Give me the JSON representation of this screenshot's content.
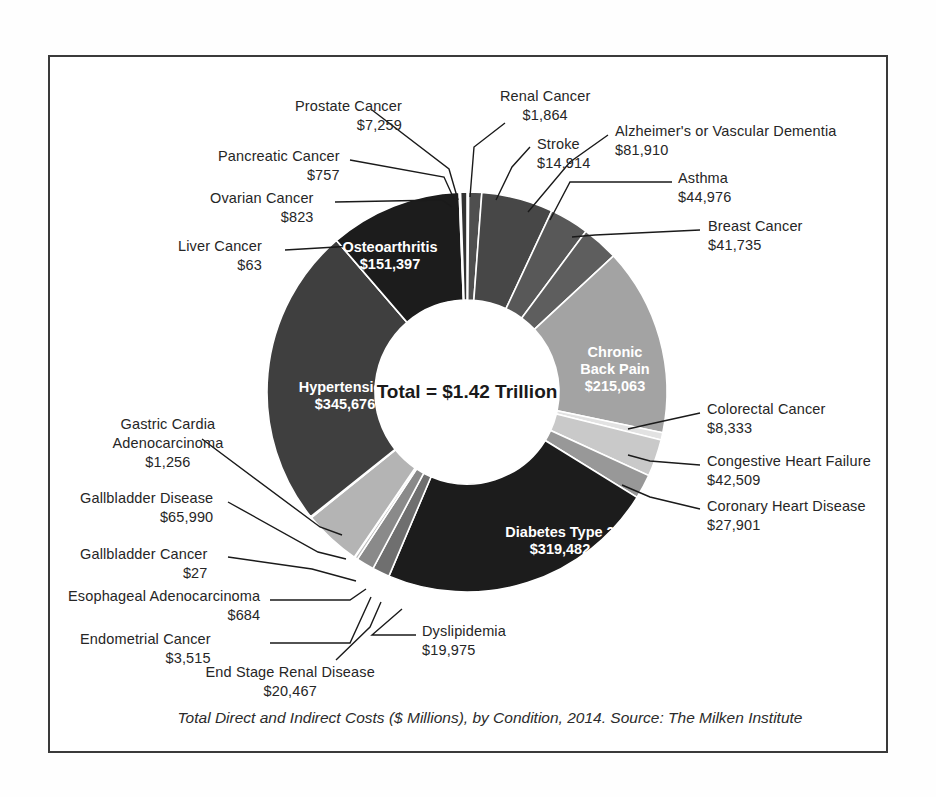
{
  "caption": "Total Direct and Indirect Costs ($ Millions), by Condition, 2014. Source: The Milken Institute",
  "center_label": "Total = $1.42 Trillion",
  "chart_data": {
    "type": "pie",
    "variant": "donut",
    "title": "",
    "subtitle": "",
    "xlabel": "",
    "ylabel": "",
    "units": "$ Millions",
    "year": "2014",
    "source": "The Milken Institute",
    "center_text": "Total = $1.42 Trillion",
    "total": 1420000,
    "total_display": "$1.42 Trillion",
    "legend": "none",
    "grid": false,
    "start_angle_deg": 0,
    "direction": "clockwise",
    "categories": [
      "Renal Cancer",
      "Stroke",
      "Alzheimer's or Vascular Dementia",
      "Asthma",
      "Breast Cancer",
      "Chronic Back Pain",
      "Colorectal Cancer",
      "Congestive Heart Failure",
      "Coronary Heart Disease",
      "Diabetes Type 2",
      "Dyslipidemia",
      "End Stage Renal Disease",
      "Endometrial Cancer",
      "Esophageal Adenocarcinoma",
      "Gallbladder Cancer",
      "Gallbladder Disease",
      "Gastric Cardia Adenocarcinoma",
      "Hypertension",
      "Liver Cancer",
      "Osteoarthritis",
      "Ovarian Cancer",
      "Pancreatic Cancer",
      "Prostate Cancer"
    ],
    "values": [
      1864,
      14914,
      81910,
      44976,
      41735,
      215063,
      8333,
      42509,
      27901,
      319482,
      19975,
      20467,
      3515,
      684,
      27,
      65990,
      1256,
      345676,
      63,
      151397,
      823,
      757,
      7259
    ],
    "value_labels": [
      "$1,864",
      "$14,914",
      "$81,910",
      "$44,976",
      "$41,735",
      "$215,063",
      "$8,333",
      "$42,509",
      "$27,901",
      "$319,482",
      "$19,975",
      "$20,467",
      "$3,515",
      "$684",
      "$27",
      "$65,990",
      "$1,256",
      "$345,676",
      "$63",
      "$151,397",
      "$823",
      "$757",
      "$7,259"
    ],
    "colors": [
      "#1c1c1c",
      "#4f4f4f",
      "#474747",
      "#585858",
      "#5e5e5e",
      "#a3a3a3",
      "#e2e2e2",
      "#c9c9c9",
      "#989898",
      "#1c1c1c",
      "#6f6f6f",
      "#8a8a8a",
      "#bdbdbd",
      "#8f8f8f",
      "#d2d2d2",
      "#b4b4b4",
      "#6b6b6b",
      "#3f3f3f",
      "#2a2a2a",
      "#1c1c1c",
      "#555555",
      "#6a6a6a",
      "#333333"
    ]
  },
  "inner_labels": [
    {
      "name": "Osteoarthritis",
      "value": "$151,397"
    },
    {
      "name": "Chronic\nBack Pain",
      "value": "$215,063"
    },
    {
      "name": "Hypertension",
      "value": "$345,676"
    },
    {
      "name": "Diabetes Type 2",
      "value": "$319,482"
    }
  ],
  "callouts": [
    {
      "name": "Prostate Cancer",
      "value": "$7,259"
    },
    {
      "name": "Renal Cancer",
      "value": "$1,864"
    },
    {
      "name": "Stroke",
      "value": "$14,914"
    },
    {
      "name": "Alzheimer's or Vascular Dementia",
      "value": "$81,910"
    },
    {
      "name": "Pancreatic Cancer",
      "value": "$757"
    },
    {
      "name": "Asthma",
      "value": "$44,976"
    },
    {
      "name": "Ovarian Cancer",
      "value": "$823"
    },
    {
      "name": "Breast Cancer",
      "value": "$41,735"
    },
    {
      "name": "Liver Cancer",
      "value": "$63"
    },
    {
      "name": "Colorectal Cancer",
      "value": "$8,333"
    },
    {
      "name": "Congestive Heart Failure",
      "value": "$42,509"
    },
    {
      "name": "Coronary Heart Disease",
      "value": "$27,901"
    },
    {
      "name": "Gastric Cardia\nAdenocarcinoma",
      "value": "$1,256"
    },
    {
      "name": "Gallbladder Disease",
      "value": "$65,990"
    },
    {
      "name": "Gallbladder Cancer",
      "value": "$27"
    },
    {
      "name": "Esophageal Adenocarcinoma",
      "value": "$684"
    },
    {
      "name": "Endometrial Cancer",
      "value": "$3,515"
    },
    {
      "name": "End Stage Renal Disease",
      "value": "$20,467"
    },
    {
      "name": "Dyslipidemia",
      "value": "$19,975"
    }
  ]
}
